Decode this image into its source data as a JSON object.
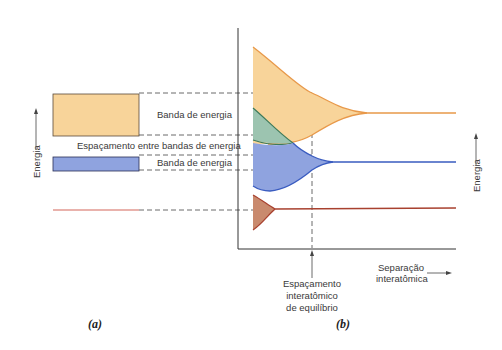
{
  "figure": {
    "panel_a": {
      "caption": "(a)",
      "y_axis_label": "Energia",
      "band_upper_label": "Banda de energia",
      "gap_label": "Espaçamento entre bandas de energia",
      "band_lower_label": "Banda de energia"
    },
    "panel_b": {
      "caption": "(b)",
      "y_axis_label": "Energia",
      "x_axis_label_line1": "Separação",
      "x_axis_label_line2": "interatômica",
      "equilibrium_label_line1": "Espaçamento",
      "equilibrium_label_line2": "interatômico",
      "equilibrium_label_line3": "de equilíbrio"
    },
    "colors": {
      "upper_band_fill": "#f8d49a",
      "upper_band_line": "#e8994a",
      "overlap_fill": "#9cc4b0",
      "overlap_line": "#3d7a5a",
      "lower_band_fill": "#8fa3df",
      "lower_band_line": "#3a5cc0",
      "core_level_fill": "#c98a6e",
      "core_level_line": "#a8412f",
      "axis": "#333333",
      "dash": "#444444"
    }
  }
}
